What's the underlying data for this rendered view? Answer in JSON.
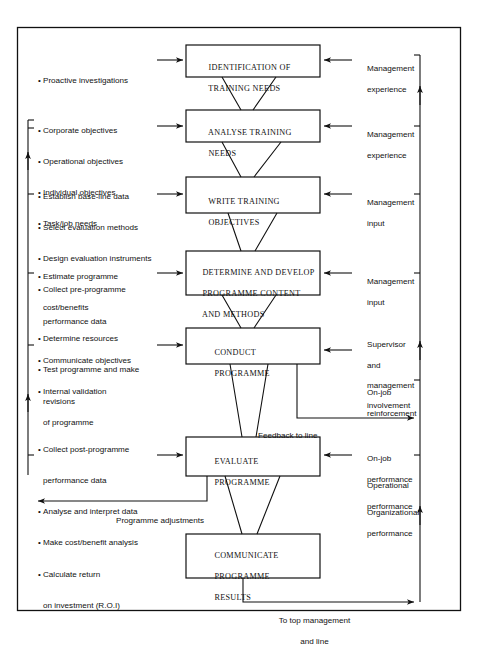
{
  "diagram": {
    "frame": {
      "stroke": "#111111"
    },
    "boxes": [
      {
        "id": "identification",
        "lines": [
          "IDENTIFICATION OF",
          "TRAINING NEEDS"
        ]
      },
      {
        "id": "analyse",
        "lines": [
          "ANALYSE TRAINING",
          "NEEDS"
        ]
      },
      {
        "id": "write",
        "lines": [
          "WRITE TRAINING",
          "OBJECTIVES"
        ]
      },
      {
        "id": "determine",
        "lines": [
          "DETERMINE AND DEVELOP",
          "PROGRAMME CONTENT",
          "AND METHODS"
        ]
      },
      {
        "id": "conduct",
        "lines": [
          "CONDUCT",
          "PROGRAMME"
        ]
      },
      {
        "id": "evaluate",
        "lines": [
          "EVALUATE",
          "PROGRAMME"
        ]
      },
      {
        "id": "communicate",
        "lines": [
          "COMMUNICATE",
          "PROGRAMME",
          "RESULTS"
        ]
      }
    ],
    "left_inputs": [
      {
        "id": "proactive",
        "items": [
          [
            "Proactive investigations"
          ]
        ]
      },
      {
        "id": "objectives",
        "items": [
          [
            "Corporate objectives"
          ],
          [
            "Operational objectives"
          ],
          [
            "Individual objectives"
          ],
          [
            "Task/job needs"
          ]
        ]
      },
      {
        "id": "evaluation-design",
        "items": [
          [
            "Establish base-line data"
          ],
          [
            "Select evaluation methods"
          ],
          [
            "Design evaluation instruments"
          ],
          [
            "Collect pre-programme",
            "performance data"
          ]
        ]
      },
      {
        "id": "resources",
        "items": [
          [
            "Estimate programme",
            "cost/benefits"
          ],
          [
            "Determine resources"
          ],
          [
            "Test programme and make",
            "revisions"
          ]
        ]
      },
      {
        "id": "communicate-objectives",
        "items": [
          [
            "Communicate objectives"
          ],
          [
            "Internal validation",
            "of programme"
          ]
        ]
      },
      {
        "id": "post-programme",
        "items": [
          [
            "Collect post-programme",
            "performance data"
          ],
          [
            "Analyse and interpret data"
          ],
          [
            "Make cost/benefit analysis"
          ],
          [
            "Calculate return",
            "on investment (R.O.I)"
          ]
        ]
      }
    ],
    "right_notes": [
      {
        "id": "mgmt-exp-1",
        "lines": [
          "Management",
          "experience"
        ],
        "arrow": true
      },
      {
        "id": "mgmt-exp-2",
        "lines": [
          "Management",
          "experience"
        ],
        "arrow": true
      },
      {
        "id": "mgmt-input-1",
        "lines": [
          "Management",
          "input"
        ],
        "arrow": true
      },
      {
        "id": "mgmt-input-2",
        "lines": [
          "Management",
          "input"
        ],
        "arrow": true
      },
      {
        "id": "supervisor",
        "lines": [
          "Supervisor",
          "and",
          "management",
          "involvement"
        ],
        "arrow": true
      },
      {
        "id": "on-job-reinforcement",
        "lines": [
          "On-job",
          "reinforcement"
        ],
        "arrow": false
      },
      {
        "id": "on-job-performance",
        "lines": [
          "On-job",
          "performance"
        ],
        "arrow": true
      },
      {
        "id": "operational-performance",
        "lines": [
          "Operational",
          "performance"
        ],
        "arrow": false
      },
      {
        "id": "organizational-performance",
        "lines": [
          "Organizational",
          "performance"
        ],
        "arrow": false
      }
    ],
    "edge_labels": [
      {
        "id": "feedback-to-line",
        "lines": [
          "Feedback to line"
        ]
      },
      {
        "id": "programme-adjustments",
        "lines": [
          "Programme adjustments"
        ]
      },
      {
        "id": "to-top-management",
        "lines": [
          "To top management",
          "and line"
        ]
      }
    ],
    "bullet_glyph": "•"
  }
}
